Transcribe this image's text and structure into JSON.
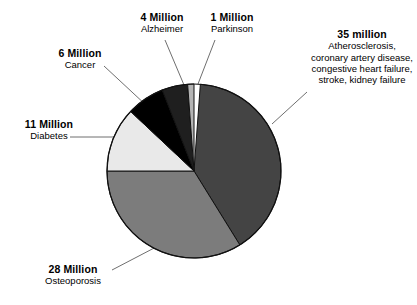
{
  "chart_data": {
    "type": "pie",
    "title": "",
    "xlabel": "",
    "ylabel": "",
    "unit": "millions of people",
    "legend_position": "callout-labels",
    "grid": false,
    "total": 85,
    "start_angle_deg": 0,
    "direction": "clockwise",
    "categories": [
      "Atherosclerosis, coronary artery disease, congestive heart failure, stroke, kidney failure",
      "Osteoporosis",
      "Diabetes",
      "Cancer",
      "Alzheimer",
      "Parkinson"
    ],
    "values": [
      35,
      28,
      11,
      6,
      4,
      1
    ],
    "colors": [
      "#444444",
      "#7c7c7c",
      "#e9e9e9",
      "#000000",
      "#1f1f1f",
      "#b4b4b4"
    ],
    "slices": [
      {
        "value_label": "35 million",
        "name": "Atherosclerosis, coronary artery disease, congestive heart failure, stroke, kidney failure",
        "value": 35,
        "color": "#444444",
        "start_deg": 4.2,
        "end_deg": 148.2
      },
      {
        "value_label": "28 Million",
        "name": "Osteoporosis",
        "value": 28,
        "color": "#7c7c7c",
        "start_deg": 148.2,
        "end_deg": 270.0
      },
      {
        "value_label": "11 Million",
        "name": "Diabetes",
        "value": 11,
        "color": "#e9e9e9",
        "start_deg": 270.0,
        "end_deg": 313.2
      },
      {
        "value_label": "6 Million",
        "name": "Cancer",
        "value": 6,
        "color": "#000000",
        "start_deg": 313.2,
        "end_deg": 338.6
      },
      {
        "value_label": "4 Million",
        "name": "Alzheimer",
        "value": 4,
        "color": "#1f1f1f",
        "start_deg": 338.6,
        "end_deg": 355.8
      },
      {
        "value_label": "1 Million",
        "name": "Parkinson",
        "value": 1,
        "color": "#b4b4b4",
        "start_deg": 355.8,
        "end_deg": 360.0
      }
    ]
  },
  "labels": {
    "athero": {
      "number": "35 million",
      "description": "Atherosclerosis, coronary artery disease, congestive heart failure, stroke, kidney failure"
    },
    "osteoporosis": {
      "number": "28 Million",
      "description": "Osteoporosis"
    },
    "diabetes": {
      "number": "11 Million",
      "description": "Diabetes"
    },
    "cancer": {
      "number": "6 Million",
      "description": "Cancer"
    },
    "alzheimer": {
      "number": "4 Million",
      "description": "Alzheimer"
    },
    "parkinson": {
      "number": "1 Million",
      "description": "Parkinson"
    }
  },
  "style": {
    "background": "#ffffff",
    "text_color": "#000000",
    "leader_line_color": "#6f6f6f",
    "pie_outline": "#111111"
  }
}
